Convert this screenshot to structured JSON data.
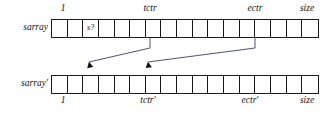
{
  "figure": {
    "ink_color": "#1a1a1a",
    "arrow_color": "#3b3f6b",
    "background": "#ffffff",
    "cell_count": 17
  },
  "rows": [
    {
      "name": "sarray",
      "label": "sarray",
      "cells": [
        {
          "index": 1,
          "text": ""
        },
        {
          "index": 2,
          "text": ""
        },
        {
          "index": 3,
          "text": "s?"
        },
        {
          "index": 4,
          "text": ""
        },
        {
          "index": 5,
          "text": ""
        },
        {
          "index": 6,
          "text": ""
        },
        {
          "index": 7,
          "text": ""
        },
        {
          "index": 8,
          "text": ""
        },
        {
          "index": 9,
          "text": ""
        },
        {
          "index": 10,
          "text": ""
        },
        {
          "index": 11,
          "text": ""
        },
        {
          "index": 12,
          "text": ""
        },
        {
          "index": 13,
          "text": ""
        },
        {
          "index": 14,
          "text": ""
        },
        {
          "index": 15,
          "text": ""
        },
        {
          "index": 16,
          "text": ""
        },
        {
          "index": 17,
          "text": ""
        }
      ],
      "markers": [
        {
          "name": "start",
          "label": "1",
          "x": 63
        },
        {
          "name": "tctr",
          "label": "tctr",
          "x": 150
        },
        {
          "name": "ectr",
          "label": "ectr",
          "x": 255
        },
        {
          "name": "size",
          "label": "size",
          "x": 307
        }
      ]
    },
    {
      "name": "sarray-prime",
      "label": "sarray′",
      "cells": [
        {
          "index": 1,
          "text": ""
        },
        {
          "index": 2,
          "text": ""
        },
        {
          "index": 3,
          "text": ""
        },
        {
          "index": 4,
          "text": ""
        },
        {
          "index": 5,
          "text": ""
        },
        {
          "index": 6,
          "text": ""
        },
        {
          "index": 7,
          "text": ""
        },
        {
          "index": 8,
          "text": ""
        },
        {
          "index": 9,
          "text": ""
        },
        {
          "index": 10,
          "text": ""
        },
        {
          "index": 11,
          "text": ""
        },
        {
          "index": 12,
          "text": ""
        },
        {
          "index": 13,
          "text": ""
        },
        {
          "index": 14,
          "text": ""
        },
        {
          "index": 15,
          "text": ""
        },
        {
          "index": 16,
          "text": ""
        },
        {
          "index": 17,
          "text": ""
        }
      ],
      "markers": [
        {
          "name": "start",
          "label": "1",
          "x": 63
        },
        {
          "name": "tctr-prime",
          "label": "tctr′",
          "x": 148
        },
        {
          "name": "ectr-prime",
          "label": "ectr′",
          "x": 250
        },
        {
          "name": "size",
          "label": "size",
          "x": 307
        }
      ]
    }
  ],
  "arrows": [
    {
      "name": "tctr-to-tctr-prime",
      "from_x": 150,
      "from_y": 38,
      "elbow_y": 48,
      "to_x": 89,
      "to_y": 70
    },
    {
      "name": "ectr-to-ectr-prime",
      "from_x": 255,
      "from_y": 38,
      "elbow_y": 48,
      "to_x": 148,
      "to_y": 70
    }
  ]
}
